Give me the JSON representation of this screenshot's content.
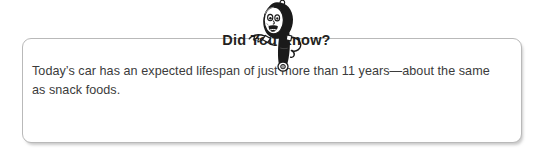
{
  "callout": {
    "title": "Did You Know?",
    "body": "Today’s car has an expected lifespan of just more than 11 years—about the same as snack foods.",
    "mascot_icon": "cartoon-mascot-icon"
  },
  "colors": {
    "page_background": "#ffffff",
    "box_background": "#ffffff",
    "box_border": "#b9b9b9",
    "title_text": "#231f20",
    "body_text": "#3b3b3b",
    "mascot_ink": "#1a1a1a",
    "mascot_fill": "#ffffff",
    "mascot_shade": "#8f8f8f"
  }
}
